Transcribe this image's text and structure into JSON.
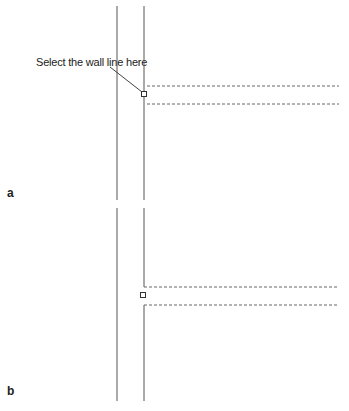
{
  "figure": {
    "callout_text": "Select the wall line here",
    "panels": [
      {
        "label": "a",
        "description": "Wall with continuous line and pick box"
      },
      {
        "label": "b",
        "description": "Wall line broken at opening"
      }
    ],
    "colors": {
      "line": "#555555",
      "dashed": "#666666",
      "text": "#222222"
    }
  }
}
